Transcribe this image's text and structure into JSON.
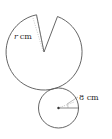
{
  "diagram": {
    "type": "geometry",
    "large_shape": {
      "kind": "circle-sector-with-wedge-removed",
      "radius_label": "r cm",
      "radius_var": "r",
      "unit": "cm"
    },
    "small_shape": {
      "kind": "circle",
      "radius_label": "8 cm",
      "radius_value": 8,
      "unit": "cm"
    },
    "colors": {
      "stroke": "#555555",
      "dashed": "#888888",
      "background": "#ffffff"
    }
  }
}
